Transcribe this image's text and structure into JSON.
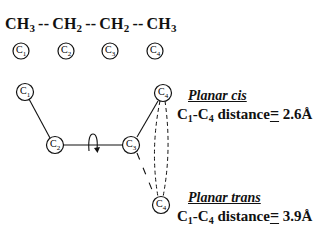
{
  "formula": {
    "groups": [
      {
        "base": "CH",
        "sub": "3"
      },
      {
        "base": "CH",
        "sub": "2"
      },
      {
        "base": "CH",
        "sub": "2"
      },
      {
        "base": "CH",
        "sub": "3"
      }
    ],
    "separator": "--",
    "carbon_labels": [
      {
        "base": "C",
        "sub": "1"
      },
      {
        "base": "C",
        "sub": "2"
      },
      {
        "base": "C",
        "sub": "3"
      },
      {
        "base": "C",
        "sub": "4"
      }
    ]
  },
  "diagram": {
    "atoms": [
      {
        "id": "C1",
        "base": "C",
        "sub": "1"
      },
      {
        "id": "C2",
        "base": "C",
        "sub": "2"
      },
      {
        "id": "C3",
        "base": "C",
        "sub": "3"
      },
      {
        "id": "C4_cis",
        "base": "C",
        "sub": "4"
      },
      {
        "id": "C4_trans",
        "base": "C",
        "sub": "4"
      }
    ],
    "rotation_symbol": "rotation-arrow"
  },
  "labels": {
    "cis": {
      "title": "Planar cis",
      "atom_a": {
        "base": "C",
        "sub": "1"
      },
      "bond": "-",
      "atom_b": {
        "base": "C",
        "sub": "4"
      },
      "text": " distance",
      "equals": "=",
      "value": "2.6",
      "unit": "Å"
    },
    "trans": {
      "title": "Planar trans",
      "atom_a": {
        "base": "C",
        "sub": "1"
      },
      "bond": "-",
      "atom_b": {
        "base": "C",
        "sub": "4"
      },
      "text": " distance",
      "equals": "=",
      "value": "3.9",
      "unit": "Å"
    }
  }
}
